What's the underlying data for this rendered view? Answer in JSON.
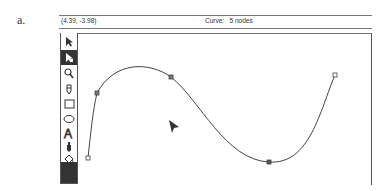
{
  "figure_label": "a.",
  "status_bar": {
    "coordinates": "(4.39, -3.98)",
    "curve_info": "Curve:   5 nodes"
  },
  "toolbar": {
    "tools": [
      {
        "name": "pointer-tool",
        "glyph": "➤",
        "active": false
      },
      {
        "name": "node-edit-tool",
        "glyph": "⬉",
        "active": true
      },
      {
        "name": "zoom-tool",
        "glyph": "🔍",
        "active": false
      },
      {
        "name": "pencil-tool",
        "glyph": "✎",
        "active": false
      },
      {
        "name": "rectangle-tool",
        "glyph": "□",
        "active": false
      },
      {
        "name": "ellipse-tool",
        "glyph": "⬭",
        "active": false
      },
      {
        "name": "text-tool",
        "glyph": "A",
        "active": false
      },
      {
        "name": "eyedropper-tool",
        "glyph": "⚱",
        "active": false
      },
      {
        "name": "fill-tool",
        "glyph": "♨",
        "active": false
      }
    ]
  },
  "curve": {
    "node_count": 5,
    "nodes": [
      [
        88,
        158
      ],
      [
        97,
        93
      ],
      [
        171,
        77
      ],
      [
        269,
        162
      ],
      [
        335,
        75
      ]
    ],
    "stroke_color": "#444444"
  },
  "cursor": {
    "x": 172,
    "y": 125
  }
}
